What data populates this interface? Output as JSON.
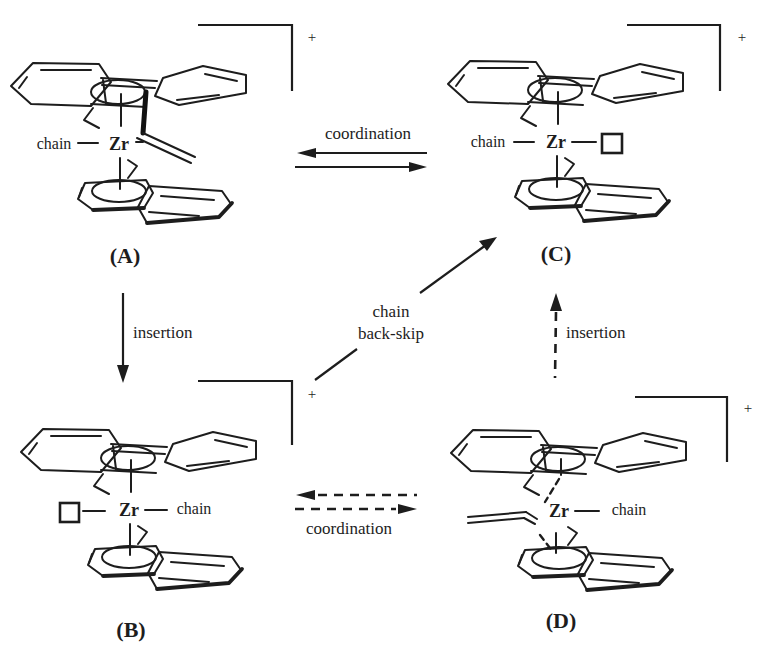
{
  "colors": {
    "ink": "#1d1d1d",
    "background": "#ffffff"
  },
  "structures": {
    "A": {
      "name": "(A)",
      "metal": "Zr",
      "ligand_label": "chain",
      "charge": "+"
    },
    "B": {
      "name": "(B)",
      "metal": "Zr",
      "ligand_label": "chain",
      "charge": "+"
    },
    "C": {
      "name": "(C)",
      "metal": "Zr",
      "ligand_label": "chain",
      "charge": "+"
    },
    "D": {
      "name": "(D)",
      "metal": "Zr",
      "ligand_label": "chain",
      "charge": "+"
    }
  },
  "arrows": {
    "coordination_top": {
      "label": "coordination"
    },
    "insertion_left": {
      "label": "insertion"
    },
    "insertion_right": {
      "label": "insertion"
    },
    "coordination_bottom": {
      "label": "coordination"
    },
    "chain_back_skip": {
      "line1": "chain",
      "line2": "back-skip"
    }
  }
}
